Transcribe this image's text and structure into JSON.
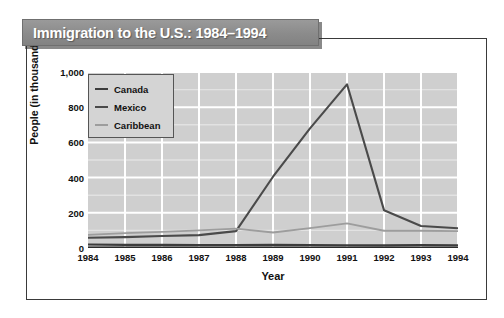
{
  "title": "Immigration to the U.S.: 1984–1994",
  "chart_data": {
    "type": "line",
    "title": "Immigration to the U.S.: 1984–1994",
    "xlabel": "Year",
    "ylabel": "People (in thousands)",
    "categories": [
      "1984",
      "1985",
      "1986",
      "1987",
      "1988",
      "1989",
      "1990",
      "1991",
      "1992",
      "1993",
      "1994"
    ],
    "x": [
      1984,
      1985,
      1986,
      1987,
      1988,
      1989,
      1990,
      1991,
      1992,
      1993,
      1994
    ],
    "series": [
      {
        "name": "Canada",
        "color": "#3c3c3c",
        "values": [
          20,
          18,
          18,
          17,
          17,
          18,
          17,
          16,
          15,
          17,
          16
        ]
      },
      {
        "name": "Mexico",
        "color": "#4a4a4a",
        "values": [
          58,
          62,
          68,
          73,
          96,
          405,
          680,
          930,
          215,
          125,
          112
        ]
      },
      {
        "name": "Caribbean",
        "color": "#9d9d9d",
        "values": [
          75,
          84,
          92,
          100,
          110,
          88,
          113,
          140,
          98,
          98,
          96
        ]
      }
    ],
    "ylim": [
      0,
      1000
    ],
    "yticks": [
      "0",
      "200",
      "400",
      "600",
      "800",
      "1,000"
    ],
    "ytick_values": [
      0,
      200,
      400,
      600,
      800,
      1000
    ],
    "grid": true,
    "legend_position": "top-left",
    "legend": [
      "Canada",
      "Mexico",
      "Caribbean"
    ]
  }
}
